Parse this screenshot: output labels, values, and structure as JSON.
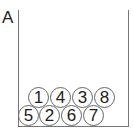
{
  "panel_label": "A",
  "balls": [
    {
      "number": "1",
      "row": "top",
      "x": 28,
      "y": 87
    },
    {
      "number": "4",
      "row": "top",
      "x": 50,
      "y": 87
    },
    {
      "number": "3",
      "row": "top",
      "x": 72,
      "y": 87
    },
    {
      "number": "8",
      "row": "top",
      "x": 94,
      "y": 87
    },
    {
      "number": "5",
      "row": "bottom",
      "x": 18,
      "y": 105
    },
    {
      "number": "2",
      "row": "bottom",
      "x": 39,
      "y": 105
    },
    {
      "number": "6",
      "row": "bottom",
      "x": 61,
      "y": 105
    },
    {
      "number": "7",
      "row": "bottom",
      "x": 83,
      "y": 105
    }
  ]
}
